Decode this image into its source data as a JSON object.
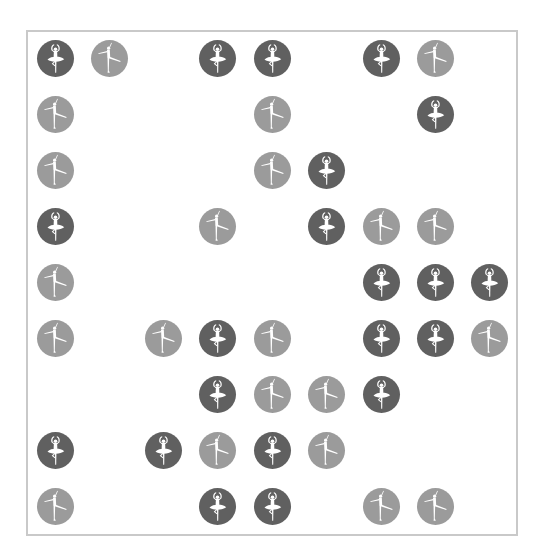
{
  "grid": {
    "rows": 9,
    "cols": 9,
    "col_centers": [
      55,
      109,
      163,
      217,
      272,
      326,
      381,
      435,
      489
    ],
    "row_centers": [
      58,
      114,
      170,
      226,
      282,
      338,
      394,
      450,
      506
    ],
    "legend": {
      "D": {
        "icon": "ballerina-tutu-icon",
        "color": "#606060",
        "label": "dark"
      },
      "L": {
        "icon": "ballerina-arabesque-icon",
        "color": "#9b9b9b",
        "label": "light"
      }
    },
    "cells": [
      [
        "D",
        "L",
        ".",
        "D",
        "D",
        ".",
        "D",
        "L",
        "."
      ],
      [
        "L",
        ".",
        ".",
        ".",
        "L",
        ".",
        ".",
        "D",
        "."
      ],
      [
        "L",
        ".",
        ".",
        ".",
        "L",
        "D",
        ".",
        ".",
        "."
      ],
      [
        "D",
        ".",
        ".",
        "L",
        ".",
        "D",
        "L",
        "L",
        "."
      ],
      [
        "L",
        ".",
        ".",
        ".",
        ".",
        ".",
        "D",
        "D",
        "D"
      ],
      [
        "L",
        ".",
        "L",
        "D",
        "L",
        ".",
        "D",
        "D",
        "L"
      ],
      [
        ".",
        ".",
        ".",
        "D",
        "L",
        "L",
        "D",
        ".",
        "."
      ],
      [
        "D",
        ".",
        "D",
        "L",
        "D",
        "L",
        ".",
        ".",
        "."
      ],
      [
        "L",
        ".",
        ".",
        "D",
        "D",
        ".",
        "L",
        "L",
        "."
      ]
    ]
  },
  "frame": {
    "border_color": "#c9c9c9"
  }
}
